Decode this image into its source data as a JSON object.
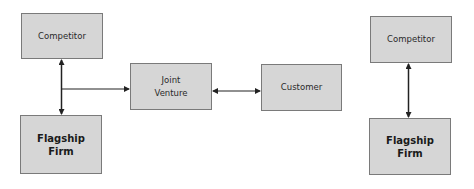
{
  "diagrams": [
    {
      "name": "joint-venture-configuration",
      "nodes": [
        {
          "id": "competitor-left",
          "label": "Competitor",
          "bold": false
        },
        {
          "id": "flagship-left",
          "label": "Flagship\nFirm",
          "bold": true
        },
        {
          "id": "joint-venture",
          "label": "Joint\nVenture",
          "bold": false
        },
        {
          "id": "customer",
          "label": "Customer",
          "bold": false
        }
      ],
      "edges": [
        {
          "from": "competitor-left",
          "to": "flagship-left",
          "type": "bidirectional"
        },
        {
          "from": "competitor-flagship-link",
          "to": "joint-venture",
          "type": "directed"
        },
        {
          "from": "joint-venture",
          "to": "customer",
          "type": "bidirectional"
        }
      ]
    },
    {
      "name": "direct-competition-configuration",
      "nodes": [
        {
          "id": "competitor-right",
          "label": "Competitor",
          "bold": false
        },
        {
          "id": "flagship-right",
          "label": "Flagship\nFirm",
          "bold": true
        }
      ],
      "edges": [
        {
          "from": "competitor-right",
          "to": "flagship-right",
          "type": "bidirectional"
        }
      ]
    }
  ],
  "labels": {
    "competitor_left": "Competitor",
    "flagship_left": "Flagship\nFirm",
    "joint_venture": "Joint\nVenture",
    "customer": "Customer",
    "competitor_right": "Competitor",
    "flagship_right": "Flagship\nFirm"
  },
  "colors": {
    "box_fill": "#d6d6d6",
    "box_border": "#7a7a7a",
    "line": "#222222",
    "background": "#ffffff"
  }
}
